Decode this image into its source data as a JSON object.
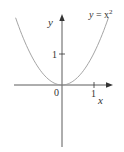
{
  "chart_data": {
    "type": "line",
    "title": "",
    "function": "y = x^2",
    "curve_label": "y = x²",
    "xlabel": "x",
    "ylabel": "y",
    "x_ticks": [
      {
        "value": 1,
        "label": "1"
      }
    ],
    "y_ticks": [
      {
        "value": 1,
        "label": "1"
      }
    ],
    "origin_label": "0",
    "xlim": [
      -1.5,
      1.55
    ],
    "ylim": [
      -2.0,
      2.1
    ],
    "grid": false,
    "series": [
      {
        "name": "y = x²",
        "x": [
          -1.45,
          -1.0,
          -0.5,
          0,
          0.5,
          1.0,
          1.45
        ],
        "y": [
          2.1,
          1.0,
          0.25,
          0,
          0.25,
          1.0,
          2.1
        ],
        "color": "#999999"
      }
    ]
  },
  "labels": {
    "curve_y": "y",
    "curve_eq": " = x",
    "curve_exp": "2",
    "x_axis": "x",
    "y_axis": "y",
    "origin": "0",
    "x_tick_1": "1",
    "y_tick_1": "1"
  },
  "colors": {
    "axis": "#333333",
    "curve": "#9a9a9a"
  }
}
